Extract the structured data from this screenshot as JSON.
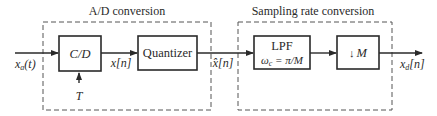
{
  "diagram": {
    "groups": [
      {
        "id": "ad",
        "title": "A/D conversion"
      },
      {
        "id": "src",
        "title": "Sampling rate conversion"
      }
    ],
    "blocks": {
      "cd": {
        "label": "C/D"
      },
      "quantizer": {
        "label": "Quantizer"
      },
      "lpf": {
        "label": "LPF",
        "sublabel_lhs": "ω",
        "sublabel_sub": "c",
        "sublabel_rhs": " = π/M"
      },
      "downsample": {
        "arrow": "↓",
        "label": "M"
      }
    },
    "signals": {
      "input": {
        "base": "x",
        "sub": "a",
        "arg": "(t)"
      },
      "sampled": {
        "label": "x[n]"
      },
      "quantized": {
        "base": "x̂",
        "arg": "[n]"
      },
      "output": {
        "base": "x",
        "sub": "d",
        "arg": "[n]"
      },
      "period": {
        "label": "T"
      }
    },
    "colors": {
      "stroke": "#2a2a2a",
      "dashed": "#555555",
      "background": "#ffffff"
    }
  }
}
